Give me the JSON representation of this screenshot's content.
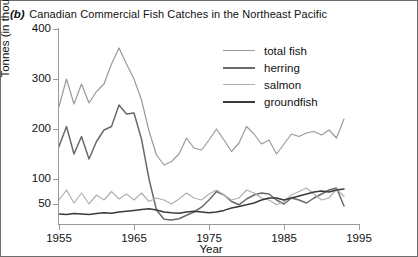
{
  "figure": {
    "panel_label": "(b)",
    "title": "Canadian Commercial Fish Catches in the Northeast Pacific"
  },
  "axes": {
    "ylabel": "Tonnes (in thousands)",
    "xlabel": "Year",
    "yticks": [
      {
        "label": "400",
        "value": 400
      },
      {
        "label": "300",
        "value": 300
      },
      {
        "label": "200",
        "value": 200
      },
      {
        "label": "100",
        "value": 100
      },
      {
        "label": "50",
        "value": 50
      }
    ],
    "xticks": [
      {
        "label": "1955",
        "value": 1955
      },
      {
        "label": "1965",
        "value": 1965
      },
      {
        "label": "1975",
        "value": 1975
      },
      {
        "label": "1985",
        "value": 1985
      },
      {
        "label": "1995",
        "value": 1995
      }
    ]
  },
  "colors": {
    "total_fish": "#9a9a9a",
    "herring": "#6a6a6a",
    "salmon": "#b0b0b0",
    "groundfish": "#3a3a3a",
    "axis": "#9a9a9a",
    "frame": "#6e6e6e",
    "text": "#111111"
  },
  "legend": {
    "position": "upper-right-inside",
    "entries": [
      {
        "label": "total fish",
        "color": "#9a9a9a"
      },
      {
        "label": "herring",
        "color": "#6a6a6a"
      },
      {
        "label": "salmon",
        "color": "#b0b0b0"
      },
      {
        "label": "groundfish",
        "color": "#3a3a3a"
      }
    ]
  },
  "chart_data": {
    "type": "line",
    "title": "Canadian Commercial Fish Catches in the Northeast Pacific",
    "xlabel": "Year",
    "ylabel": "Tonnes (in thousands)",
    "xlim": [
      1955,
      1995
    ],
    "ylim": [
      0,
      400
    ],
    "yticks": [
      50,
      100,
      200,
      300,
      400
    ],
    "yscale": "piecewise-compressed-below-100",
    "xticks": [
      1955,
      1965,
      1975,
      1985,
      1995
    ],
    "grid": false,
    "x": [
      1955,
      1956,
      1957,
      1958,
      1959,
      1960,
      1961,
      1962,
      1963,
      1964,
      1965,
      1966,
      1967,
      1968,
      1969,
      1970,
      1971,
      1972,
      1973,
      1974,
      1975,
      1976,
      1977,
      1978,
      1979,
      1980,
      1981,
      1982,
      1983,
      1984,
      1985,
      1986,
      1987,
      1988,
      1989,
      1990,
      1991,
      1992,
      1993
    ],
    "series": [
      {
        "name": "total fish",
        "color": "#9a9a9a",
        "values": [
          245,
          300,
          250,
          290,
          252,
          275,
          290,
          330,
          362,
          330,
          300,
          258,
          196,
          148,
          128,
          135,
          150,
          182,
          162,
          158,
          178,
          200,
          178,
          155,
          172,
          205,
          190,
          170,
          178,
          150,
          170,
          190,
          185,
          192,
          195,
          188,
          198,
          182,
          220
        ]
      },
      {
        "name": "herring",
        "color": "#6a6a6a",
        "values": [
          165,
          205,
          150,
          185,
          140,
          175,
          198,
          205,
          248,
          230,
          232,
          180,
          100,
          35,
          12,
          10,
          13,
          22,
          30,
          42,
          58,
          75,
          68,
          55,
          48,
          60,
          68,
          72,
          70,
          58,
          50,
          62,
          58,
          52,
          62,
          70,
          78,
          82,
          45
        ]
      },
      {
        "name": "salmon",
        "color": "#b0b0b0",
        "values": [
          58,
          78,
          52,
          72,
          50,
          68,
          58,
          75,
          60,
          70,
          58,
          72,
          55,
          62,
          58,
          50,
          60,
          72,
          62,
          58,
          70,
          78,
          68,
          58,
          62,
          78,
          72,
          62,
          58,
          48,
          55,
          68,
          75,
          82,
          70,
          58,
          62,
          80,
          65
        ]
      },
      {
        "name": "groundfish",
        "color": "#3a3a3a",
        "values": [
          25,
          24,
          26,
          25,
          24,
          26,
          28,
          27,
          30,
          32,
          34,
          36,
          38,
          35,
          30,
          28,
          27,
          30,
          32,
          30,
          28,
          30,
          34,
          40,
          44,
          48,
          52,
          58,
          62,
          62,
          58,
          62,
          66,
          70,
          74,
          76,
          74,
          78,
          80
        ]
      }
    ]
  }
}
